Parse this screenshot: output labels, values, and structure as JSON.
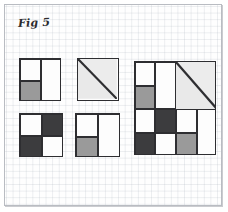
{
  "figure": {
    "label": "Fig 5",
    "caption_text": "Fig 5",
    "background": "#fefefe",
    "frame_color": "#b9bcc2",
    "ink_color": "#2e2e31",
    "grid_color": "#aab2be"
  },
  "palette": {
    "white": "#fdfdfd",
    "light": "#e9e9e9",
    "medium_gray": "#9a9a9a",
    "dark_gray": "#3c3c3e"
  },
  "blocks": [
    {
      "id": "block-top-left",
      "name": "two-patch-with-gray-foot",
      "x": 14,
      "y": 53,
      "w": 42,
      "h": 43,
      "kind": "patch",
      "cells": [
        {
          "name": "top-left-white",
          "x": 0,
          "y": 0,
          "w": 21,
          "h": 22,
          "fill": "#fdfdfd"
        },
        {
          "name": "bottom-left-gray",
          "x": 0,
          "y": 22,
          "w": 21,
          "h": 21,
          "fill": "#9a9a9a"
        },
        {
          "name": "right-half-white",
          "x": 21,
          "y": 0,
          "w": 21,
          "h": 43,
          "fill": "#fdfdfd"
        }
      ]
    },
    {
      "id": "block-top-middle",
      "name": "half-square-triangle",
      "x": 72,
      "y": 53,
      "w": 42,
      "h": 43,
      "kind": "triangle",
      "cells": [
        {
          "name": "lower-left-triangle",
          "fill": "#e9e9e9"
        },
        {
          "name": "upper-right-triangle",
          "fill": "#ececec"
        }
      ],
      "diagonal": "top-left-to-bottom-right"
    },
    {
      "id": "block-bottom-left",
      "name": "four-patch-checkerboard",
      "x": 14,
      "y": 108,
      "w": 44,
      "h": 44,
      "kind": "patch",
      "cells": [
        {
          "name": "top-left-white",
          "x": 0,
          "y": 0,
          "w": 22,
          "h": 22,
          "fill": "#fdfdfd"
        },
        {
          "name": "top-right-dark",
          "x": 22,
          "y": 0,
          "w": 22,
          "h": 22,
          "fill": "#3c3c3e"
        },
        {
          "name": "bottom-left-dark",
          "x": 0,
          "y": 22,
          "w": 22,
          "h": 22,
          "fill": "#3c3c3e"
        },
        {
          "name": "bottom-right-white",
          "x": 22,
          "y": 22,
          "w": 22,
          "h": 22,
          "fill": "#fdfdfd"
        }
      ]
    },
    {
      "id": "block-bottom-middle",
      "name": "two-patch-with-gray-foot",
      "x": 70,
      "y": 108,
      "w": 45,
      "h": 44,
      "kind": "patch",
      "cells": [
        {
          "name": "top-left-white",
          "x": 0,
          "y": 0,
          "w": 22,
          "h": 23,
          "fill": "#fdfdfd"
        },
        {
          "name": "bottom-left-gray",
          "x": 0,
          "y": 23,
          "w": 22,
          "h": 21,
          "fill": "#9a9a9a"
        },
        {
          "name": "right-half-white",
          "x": 22,
          "y": 0,
          "w": 23,
          "h": 44,
          "fill": "#fdfdfd"
        }
      ]
    }
  ],
  "composite_block": {
    "id": "block-large-right",
    "name": "assembled-quilt-block",
    "x": 129,
    "y": 56,
    "w": 82,
    "h": 94,
    "quadrants": [
      {
        "name": "quadrant-top-left-two-patch",
        "x": 0,
        "y": 0,
        "w": 41,
        "h": 47,
        "cells": [
          {
            "name": "top-left-white",
            "x": 0,
            "y": 0,
            "w": 20,
            "h": 24,
            "fill": "#fdfdfd"
          },
          {
            "name": "bottom-left-gray",
            "x": 0,
            "y": 24,
            "w": 20,
            "h": 23,
            "fill": "#9a9a9a"
          },
          {
            "name": "right-half-white",
            "x": 20,
            "y": 0,
            "w": 21,
            "h": 47,
            "fill": "#fdfdfd"
          }
        ]
      },
      {
        "name": "quadrant-top-right-triangle",
        "x": 41,
        "y": 0,
        "w": 41,
        "h": 47,
        "diagonal": "top-left-to-bottom-right",
        "cells": [
          {
            "name": "lower-left-triangle",
            "fill": "#e9e9e9"
          },
          {
            "name": "upper-right-triangle",
            "fill": "#ececec"
          }
        ]
      },
      {
        "name": "quadrant-bottom-left-four-patch",
        "x": 0,
        "y": 47,
        "w": 41,
        "h": 47,
        "cells": [
          {
            "name": "top-left-white",
            "x": 0,
            "y": 0,
            "w": 20,
            "h": 24,
            "fill": "#fdfdfd"
          },
          {
            "name": "top-right-dark",
            "x": 20,
            "y": 0,
            "w": 21,
            "h": 24,
            "fill": "#3c3c3e"
          },
          {
            "name": "bottom-left-dark",
            "x": 0,
            "y": 24,
            "w": 20,
            "h": 23,
            "fill": "#3c3c3e"
          },
          {
            "name": "bottom-right-white",
            "x": 20,
            "y": 24,
            "w": 21,
            "h": 23,
            "fill": "#fdfdfd"
          }
        ]
      },
      {
        "name": "quadrant-bottom-right-two-patch",
        "x": 41,
        "y": 47,
        "w": 41,
        "h": 47,
        "cells": [
          {
            "name": "top-left-white",
            "x": 0,
            "y": 0,
            "w": 21,
            "h": 24,
            "fill": "#fdfdfd"
          },
          {
            "name": "bottom-left-gray",
            "x": 0,
            "y": 24,
            "w": 21,
            "h": 23,
            "fill": "#9a9a9a"
          },
          {
            "name": "right-half-white",
            "x": 21,
            "y": 0,
            "w": 20,
            "h": 47,
            "fill": "#fdfdfd"
          }
        ]
      }
    ]
  }
}
